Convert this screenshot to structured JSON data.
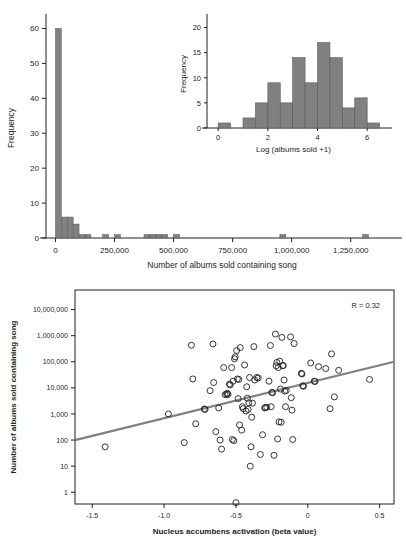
{
  "figure": {
    "panels": [
      "histogram-panel",
      "scatter-panel"
    ]
  },
  "chart_data": [
    {
      "id": "main-histogram",
      "type": "bar",
      "title": "",
      "xlabel": "Number of albums sold containing song",
      "ylabel": "Frequency",
      "xlim": [
        -40000,
        1450000
      ],
      "ylim": [
        0,
        63
      ],
      "xticks": [
        0,
        250000,
        500000,
        750000,
        1000000,
        1250000
      ],
      "xtick_labels": [
        "0",
        "250,000",
        "500,000",
        "750,000",
        "1,000,000",
        "1,250,000"
      ],
      "yticks": [
        0,
        10,
        20,
        30,
        40,
        50,
        60
      ],
      "ytick_labels": [
        "0",
        "10",
        "20",
        "30",
        "40",
        "50",
        "60"
      ],
      "grid": false,
      "bar_color": "#808080",
      "bin_width": 25000,
      "bins": [
        {
          "x0": 0,
          "x1": 25000,
          "value": 60
        },
        {
          "x0": 25000,
          "x1": 50000,
          "value": 6
        },
        {
          "x0": 50000,
          "x1": 75000,
          "value": 6
        },
        {
          "x0": 75000,
          "x1": 100000,
          "value": 4
        },
        {
          "x0": 100000,
          "x1": 125000,
          "value": 1
        },
        {
          "x0": 125000,
          "x1": 150000,
          "value": 1
        },
        {
          "x0": 200000,
          "x1": 225000,
          "value": 1
        },
        {
          "x0": 250000,
          "x1": 275000,
          "value": 1
        },
        {
          "x0": 375000,
          "x1": 400000,
          "value": 1
        },
        {
          "x0": 400000,
          "x1": 425000,
          "value": 1
        },
        {
          "x0": 425000,
          "x1": 450000,
          "value": 1
        },
        {
          "x0": 450000,
          "x1": 475000,
          "value": 1
        },
        {
          "x0": 500000,
          "x1": 525000,
          "value": 1
        },
        {
          "x0": 950000,
          "x1": 975000,
          "value": 1
        },
        {
          "x0": 1300000,
          "x1": 1325000,
          "value": 1
        }
      ]
    },
    {
      "id": "inset-histogram",
      "type": "bar",
      "title": "",
      "xlabel": "Log (albums sold +1)",
      "ylabel": "Frequency",
      "xlim": [
        -0.45,
        7.0
      ],
      "ylim": [
        0,
        21.5
      ],
      "xticks": [
        0,
        2,
        4,
        6
      ],
      "xtick_labels": [
        "0",
        "2",
        "4",
        "6"
      ],
      "yticks": [
        0,
        5,
        10,
        15,
        20
      ],
      "ytick_labels": [
        "0",
        "5",
        "10",
        "15",
        "20"
      ],
      "grid": false,
      "bar_color": "#808080",
      "bin_width": 0.5,
      "bins": [
        {
          "x0": 0.0,
          "x1": 0.5,
          "value": 1
        },
        {
          "x0": 1.0,
          "x1": 1.5,
          "value": 2
        },
        {
          "x0": 1.5,
          "x1": 2.0,
          "value": 5
        },
        {
          "x0": 2.0,
          "x1": 2.5,
          "value": 9
        },
        {
          "x0": 2.5,
          "x1": 3.0,
          "value": 5
        },
        {
          "x0": 3.0,
          "x1": 3.5,
          "value": 14
        },
        {
          "x0": 3.5,
          "x1": 4.0,
          "value": 9
        },
        {
          "x0": 4.0,
          "x1": 4.5,
          "value": 17
        },
        {
          "x0": 4.5,
          "x1": 5.0,
          "value": 14
        },
        {
          "x0": 5.0,
          "x1": 5.5,
          "value": 4
        },
        {
          "x0": 5.5,
          "x1": 6.0,
          "value": 6
        },
        {
          "x0": 6.0,
          "x1": 6.5,
          "value": 1
        }
      ]
    },
    {
      "id": "scatter-plot",
      "type": "scatter",
      "title": "",
      "xlabel": "Nucleus accumbens activation (beta value)",
      "ylabel": "Number of albums sold containing song",
      "xlim": [
        -1.62,
        0.6
      ],
      "ylim_log10": [
        -0.45,
        7.75
      ],
      "yscale": "log",
      "xticks": [
        -1.5,
        -1.0,
        -0.5,
        0,
        0.5
      ],
      "xtick_labels": [
        "-1.5",
        "-1.0",
        "-0.5",
        "0",
        "0.5"
      ],
      "yticks": [
        1,
        10,
        100,
        1000,
        10000,
        100000,
        1000000,
        10000000
      ],
      "ytick_labels": [
        "1",
        "10",
        "100",
        "1,000",
        "10,000",
        "100,000",
        "1,000,000",
        "10,000,000"
      ],
      "grid": false,
      "marker": "open-circle",
      "marker_color": "#231f20",
      "annotation": "R = 0.32",
      "correlation_r": 0.32,
      "trendline": {
        "color": "#808080",
        "x_start": -1.62,
        "y_start": 100,
        "x_end": 0.6,
        "y_end": 100000
      },
      "points": [
        {
          "x": -1.41,
          "y": 55
        },
        {
          "x": -0.97,
          "y": 1000
        },
        {
          "x": -0.86,
          "y": 80
        },
        {
          "x": -0.81,
          "y": 430000
        },
        {
          "x": -0.8,
          "y": 22000
        },
        {
          "x": -0.78,
          "y": 420
        },
        {
          "x": -0.72,
          "y": 1550
        },
        {
          "x": -0.715,
          "y": 1500
        },
        {
          "x": -0.68,
          "y": 7800
        },
        {
          "x": -0.66,
          "y": 480000
        },
        {
          "x": -0.655,
          "y": 16000
        },
        {
          "x": -0.64,
          "y": 210
        },
        {
          "x": -0.62,
          "y": 1700
        },
        {
          "x": -0.61,
          "y": 100
        },
        {
          "x": -0.6,
          "y": 45
        },
        {
          "x": -0.585,
          "y": 60000
        },
        {
          "x": -0.575,
          "y": 5500
        },
        {
          "x": -0.565,
          "y": 5800
        },
        {
          "x": -0.56,
          "y": 6200
        },
        {
          "x": -0.555,
          "y": 5600
        },
        {
          "x": -0.545,
          "y": 14000
        },
        {
          "x": -0.54,
          "y": 13000
        },
        {
          "x": -0.53,
          "y": 60000
        },
        {
          "x": -0.525,
          "y": 105
        },
        {
          "x": -0.52,
          "y": 18000
        },
        {
          "x": -0.515,
          "y": 95
        },
        {
          "x": -0.51,
          "y": 130000
        },
        {
          "x": -0.505,
          "y": 155000
        },
        {
          "x": -0.5,
          "y": 0.4
        },
        {
          "x": -0.495,
          "y": 270000
        },
        {
          "x": -0.49,
          "y": 22000
        },
        {
          "x": -0.485,
          "y": 3900
        },
        {
          "x": -0.48,
          "y": 21000
        },
        {
          "x": -0.475,
          "y": 380
        },
        {
          "x": -0.47,
          "y": 350000
        },
        {
          "x": -0.46,
          "y": 240
        },
        {
          "x": -0.455,
          "y": 1900
        },
        {
          "x": -0.45,
          "y": 1600
        },
        {
          "x": -0.44,
          "y": 75000
        },
        {
          "x": -0.43,
          "y": 1300
        },
        {
          "x": -0.425,
          "y": 11000
        },
        {
          "x": -0.42,
          "y": 4000
        },
        {
          "x": -0.415,
          "y": 1500
        },
        {
          "x": -0.41,
          "y": 2700
        },
        {
          "x": -0.405,
          "y": 25000
        },
        {
          "x": -0.4,
          "y": 10
        },
        {
          "x": -0.395,
          "y": 55
        },
        {
          "x": -0.39,
          "y": 750
        },
        {
          "x": -0.385,
          "y": 2600
        },
        {
          "x": -0.375,
          "y": 380000
        },
        {
          "x": -0.37,
          "y": 20000
        },
        {
          "x": -0.355,
          "y": 25000
        },
        {
          "x": -0.345,
          "y": 24000
        },
        {
          "x": -0.33,
          "y": 28
        },
        {
          "x": -0.315,
          "y": 160
        },
        {
          "x": -0.3,
          "y": 1700
        },
        {
          "x": -0.295,
          "y": 1750
        },
        {
          "x": -0.285,
          "y": 1800
        },
        {
          "x": -0.27,
          "y": 18000
        },
        {
          "x": -0.26,
          "y": 420000
        },
        {
          "x": -0.255,
          "y": 1900
        },
        {
          "x": -0.25,
          "y": 6700
        },
        {
          "x": -0.245,
          "y": 6500
        },
        {
          "x": -0.235,
          "y": 26
        },
        {
          "x": -0.225,
          "y": 1,
          "y_override": 1150000
        },
        {
          "x": -0.22,
          "y": 70000
        },
        {
          "x": -0.215,
          "y": 95000
        },
        {
          "x": -0.21,
          "y": 110
        },
        {
          "x": -0.205,
          "y": 60000
        },
        {
          "x": -0.2,
          "y": 500
        },
        {
          "x": -0.195,
          "y": 105000
        },
        {
          "x": -0.19,
          "y": 9000
        },
        {
          "x": -0.185,
          "y": 480
        },
        {
          "x": -0.18,
          "y": 860000
        },
        {
          "x": -0.175,
          "y": 70000
        },
        {
          "x": -0.17,
          "y": 72000
        },
        {
          "x": -0.165,
          "y": 20000
        },
        {
          "x": -0.16,
          "y": 7500
        },
        {
          "x": -0.155,
          "y": 1900
        },
        {
          "x": -0.15,
          "y": 8000
        },
        {
          "x": -0.12,
          "y": 900000
        },
        {
          "x": -0.115,
          "y": 4200
        },
        {
          "x": -0.11,
          "y": 1400
        },
        {
          "x": -0.105,
          "y": 105
        },
        {
          "x": -0.095,
          "y": 500000
        },
        {
          "x": -0.045,
          "y": 36000
        },
        {
          "x": -0.04,
          "y": 34000
        },
        {
          "x": -0.035,
          "y": 12000
        },
        {
          "x": -0.03,
          "y": 11500
        },
        {
          "x": 0.02,
          "y": 90000
        },
        {
          "x": 0.045,
          "y": 18000
        },
        {
          "x": 0.05,
          "y": 17500
        },
        {
          "x": 0.075,
          "y": 65000
        },
        {
          "x": 0.125,
          "y": 55000
        },
        {
          "x": 0.155,
          "y": 1600
        },
        {
          "x": 0.165,
          "y": 200000
        },
        {
          "x": 0.185,
          "y": 4500
        },
        {
          "x": 0.215,
          "y": 47000
        },
        {
          "x": 0.43,
          "y": 21000
        }
      ]
    }
  ]
}
